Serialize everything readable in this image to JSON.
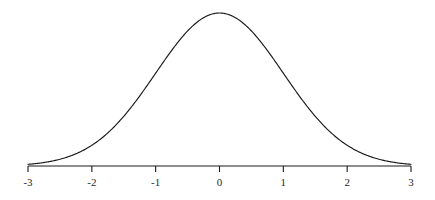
{
  "figure": {
    "background_color": "#ffffff",
    "line_color": "#1a1a1a",
    "label_color": "#2b2b2b",
    "width": 435,
    "height": 200
  },
  "axis": {
    "x_start_px": 28,
    "x_end_px": 411,
    "baseline_y_px": 166,
    "peak_y_px": 13,
    "tick_length_px": 6,
    "tick_label_y_px": 177
  },
  "chart_data": {
    "type": "line",
    "title": "",
    "subtitle": "",
    "xlabel": "",
    "ylabel": "",
    "grid": false,
    "legend": false,
    "legend_position": "none",
    "xlim": [
      -3,
      3
    ],
    "ylim": [
      0,
      0.39894228
    ],
    "xticks": [
      -3,
      -2,
      -1,
      0,
      1,
      2,
      3
    ],
    "xtick_labels": [
      "-3",
      "-2",
      "-1",
      "0",
      "1",
      "2",
      "3"
    ],
    "yticks": [],
    "ytick_labels": [],
    "annotations": [],
    "series": [
      {
        "name": "standard normal pdf",
        "formula": "y = exp(-x^2 / 2) / sqrt(2*pi)",
        "mean": 0,
        "std_dev": 1,
        "x": [
          -3.0,
          -2.8,
          -2.6,
          -2.4,
          -2.2,
          -2.0,
          -1.8,
          -1.6,
          -1.4,
          -1.2,
          -1.0,
          -0.8,
          -0.6,
          -0.4,
          -0.2,
          0.0,
          0.2,
          0.4,
          0.6,
          0.8,
          1.0,
          1.2,
          1.4,
          1.6,
          1.8,
          2.0,
          2.2,
          2.4,
          2.6,
          2.8,
          3.0
        ],
        "values": [
          0.0044,
          0.0079,
          0.0136,
          0.0224,
          0.0355,
          0.054,
          0.079,
          0.1109,
          0.1497,
          0.1942,
          0.242,
          0.2897,
          0.3332,
          0.3683,
          0.391,
          0.3989,
          0.391,
          0.3683,
          0.3332,
          0.2897,
          0.242,
          0.1942,
          0.1497,
          0.1109,
          0.079,
          0.054,
          0.0355,
          0.0224,
          0.0136,
          0.0079,
          0.0044
        ]
      }
    ]
  }
}
